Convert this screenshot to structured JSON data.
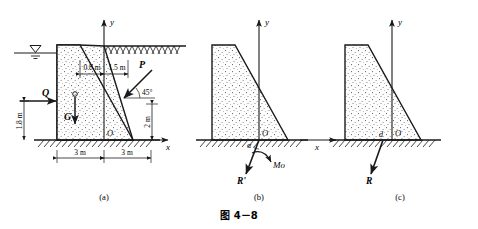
{
  "figure": {
    "caption": "图 4－8",
    "subfigures": [
      {
        "key": "a",
        "label": "(a)"
      },
      {
        "key": "b",
        "label": "(b)"
      },
      {
        "key": "c",
        "label": "(c)"
      }
    ]
  },
  "diagram_a": {
    "axis_x": "x",
    "axis_y": "y",
    "origin_label": "O",
    "forces": [
      {
        "name": "Q",
        "label": "Q",
        "direction": "horizontal-right",
        "description": "water pressure on upstream face"
      },
      {
        "name": "G",
        "label": "G",
        "direction": "vertical-down",
        "description": "self weight at centroid"
      },
      {
        "name": "P",
        "label": "P",
        "direction": "45-degree-down-left",
        "description": "inclined load on sloped face"
      }
    ],
    "angle_label": "45°",
    "dimensions": [
      {
        "name": "top-left-width",
        "value": "0.8 m"
      },
      {
        "name": "top-right-width",
        "value": "1.5 m"
      },
      {
        "name": "water-depth",
        "value": "1.8 m"
      },
      {
        "name": "right-height",
        "value": "2 m"
      },
      {
        "name": "base-left",
        "value": "3 m"
      },
      {
        "name": "base-right",
        "value": "3 m"
      }
    ],
    "water_symbol": "water-level-triangle"
  },
  "diagram_b": {
    "axis_x": "x",
    "axis_y": "y",
    "origin_label": "O",
    "resultant_force_label": "R'",
    "moment_label": "Mo",
    "angle_label": "α"
  },
  "diagram_c": {
    "axis_x": "x",
    "axis_y": "y",
    "origin_label": "O",
    "resultant_force_label": "R",
    "distance_label": "d"
  },
  "colors": {
    "line": "#1a1a1a",
    "fill": "#fdfdfd",
    "speckle": "#555555",
    "axis": "#1a1a1a"
  }
}
